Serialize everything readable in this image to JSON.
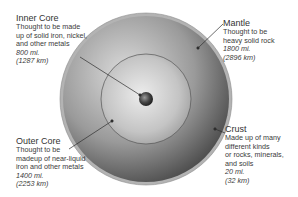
{
  "diagram": {
    "layers": [
      {
        "id": "inner-core",
        "name": "Inner Core",
        "description": [
          "Thought to be made",
          "up of solid iron, nickel,",
          "and other metals"
        ],
        "thickness_mi": "800 mi.",
        "thickness_km": "(1287 km)"
      },
      {
        "id": "mantle",
        "name": "Mantle",
        "description": [
          "Thought to be",
          "heavy solid rock"
        ],
        "thickness_mi": "1800 mi.",
        "thickness_km": "(2896 km)"
      },
      {
        "id": "outer-core",
        "name": "Outer Core",
        "description": [
          "Thought to be",
          "madeup of near-liquid",
          "iron and other metals"
        ],
        "thickness_mi": "1400 mi.",
        "thickness_km": "(2253 km)"
      },
      {
        "id": "crust",
        "name": "Crust",
        "description": [
          "Made up of many",
          "different kinds",
          "or rocks, minerals,",
          "and soils"
        ],
        "thickness_mi": "20 mi.",
        "thickness_km": "(32 km)"
      }
    ],
    "colors": {
      "crust": "#a9a9a9",
      "mantle_light": "#d0d0d0",
      "mantle_dark": "#4a4a4a",
      "outer_core_light": "#e2e2e2",
      "outer_core_dark": "#8a8a8a",
      "inner_core": "#3a3a3a",
      "leader_line": "#333333"
    }
  }
}
